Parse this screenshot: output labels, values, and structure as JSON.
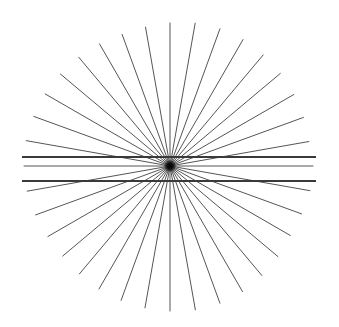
{
  "figure": {
    "name": "hering-illusion",
    "canvas": {
      "width": 339,
      "height": 327,
      "background_color": "#ffffff"
    },
    "background_color": "#ffffff"
  },
  "chart_data": {
    "type": "scatter",
    "subtitle": "Radial sunburst with two straight parallel horizontal lines",
    "xlabel": "",
    "ylabel": "",
    "xlim": [
      0,
      339
    ],
    "ylim": [
      0,
      327
    ],
    "grid": false,
    "legend": "none",
    "annotations": [],
    "tick_labels": {
      "x": [],
      "y": []
    },
    "series": [
      {
        "name": "radial-rays",
        "type": "rays",
        "center_x": 170,
        "center_y": 166,
        "count": 36,
        "radius": 145,
        "angle_start_deg": 0,
        "angle_step_deg": 10,
        "color": "#555555",
        "width": 1.0,
        "radius_per_ray": [
          143,
          142,
          140,
          139,
          141,
          143,
          145,
          146,
          146,
          145,
          144,
          143,
          142,
          141,
          140,
          141,
          143,
          145,
          146,
          146,
          145,
          144,
          143,
          142,
          141,
          140,
          141,
          143,
          145,
          146,
          146,
          145,
          144,
          143,
          142,
          141
        ]
      },
      {
        "name": "parallel-line-upper",
        "type": "line",
        "x": [
          22,
          316
        ],
        "y": [
          157,
          157
        ],
        "color": "#3a3a3a",
        "width": 1.9
      },
      {
        "name": "parallel-line-lower",
        "type": "line",
        "x": [
          22,
          316
        ],
        "y": [
          181,
          181
        ],
        "color": "#3a3a3a",
        "width": 1.9
      },
      {
        "name": "center-blob",
        "type": "point",
        "x": [
          170
        ],
        "y": [
          166
        ],
        "radius": 7,
        "color": "#111111"
      }
    ]
  }
}
